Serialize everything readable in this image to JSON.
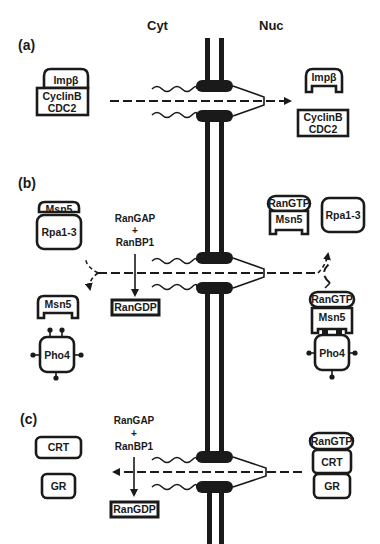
{
  "headers": {
    "cytoplasm": "Cyt",
    "nucleus": "Nuc"
  },
  "panels": {
    "a": {
      "label": "(a)",
      "cyt_complex": {
        "receptor": "Impβ",
        "cargo_line1": "CyclinB",
        "cargo_line2": "CDC2"
      },
      "nuc_receptor": "Impβ",
      "nuc_cargo": {
        "line1": "CyclinB",
        "line2": "CDC2"
      }
    },
    "b": {
      "label": "(b)",
      "cyt_complex": {
        "receptor": "Msn5",
        "cargo": "Rpa1-3"
      },
      "enzymes": {
        "line1": "RanGAP",
        "plus": "+",
        "line2": "RanBP1"
      },
      "product": "RanGDP",
      "cyt_receptor": "Msn5",
      "cyt_cargo": "Pho4",
      "nuc_complex_1": {
        "ran": "RanGTP",
        "receptor": "Msn5"
      },
      "nuc_cargo_1": "Rpa1-3",
      "nuc_complex_2": {
        "ran": "RanGTP",
        "receptor": "Msn5",
        "cargo": "Pho4"
      }
    },
    "c": {
      "label": "(c)",
      "cyt_cargo_1": "CRT",
      "cyt_cargo_2": "GR",
      "enzymes": {
        "line1": "RanGAP",
        "plus": "+",
        "line2": "RanBP1"
      },
      "product": "RanGDP",
      "nuc_complex": {
        "ran": "RanGTP",
        "receptor": "CRT",
        "cargo": "GR"
      }
    }
  }
}
